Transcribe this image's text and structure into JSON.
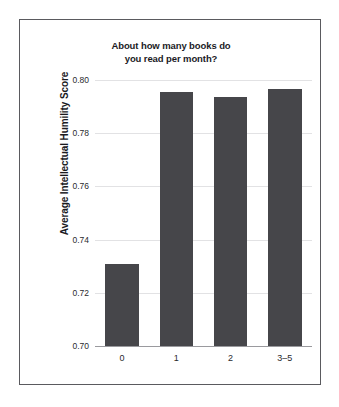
{
  "chart_data": {
    "type": "bar",
    "title": "About how many books do you read per month?",
    "title_lines": [
      "About how many books do",
      "you read per month?"
    ],
    "xlabel": "",
    "ylabel": "Average Intellectual Humility Score",
    "categories": [
      "0",
      "1",
      "2",
      "3–5"
    ],
    "values": [
      0.731,
      0.7956,
      0.7935,
      0.7968
    ],
    "ylim": [
      0.7,
      0.8
    ],
    "yticks": [
      0.7,
      0.72,
      0.74,
      0.76,
      0.78,
      0.8
    ],
    "ytick_labels": [
      "0.70",
      "0.72",
      "0.74",
      "0.76",
      "0.78",
      "0.80"
    ],
    "grid": true,
    "legend": false,
    "bar_color": "#46464a",
    "grid_color": "#e2e2e4",
    "frame_color": "#5a5a5e",
    "background": "#ffffff"
  }
}
